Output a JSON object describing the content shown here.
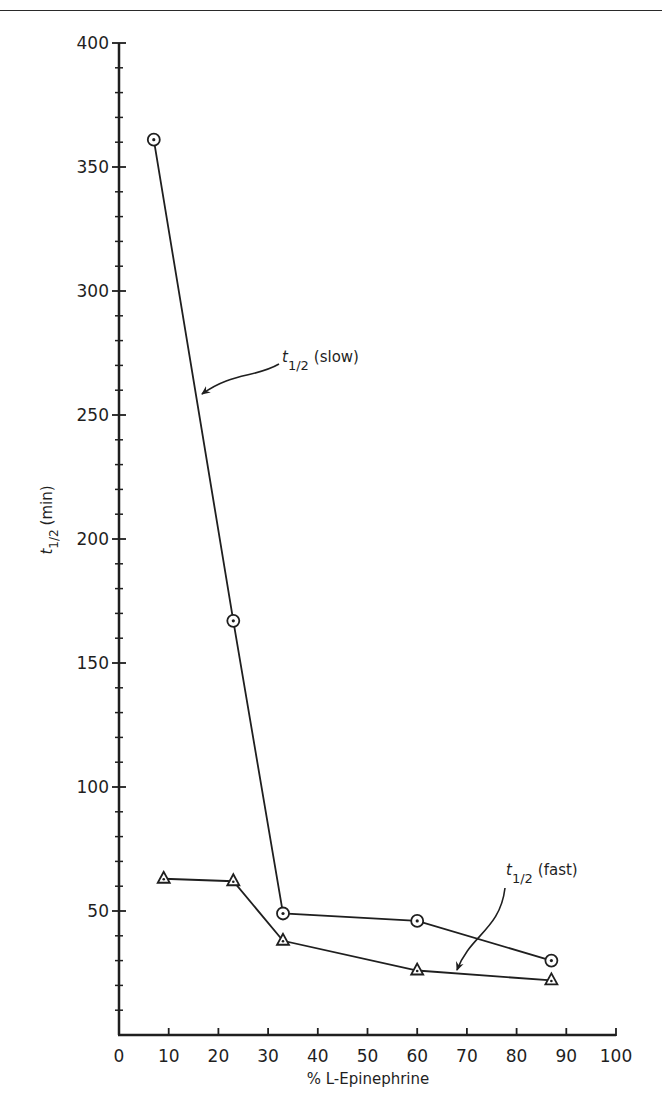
{
  "chart_data": {
    "type": "line",
    "title": "",
    "xlabel": "% L-Epinephrine",
    "ylabel": "t1/2 (min)",
    "ylabel_parts": {
      "t": "t",
      "sub": "1/2",
      "rest": "(min)"
    },
    "xlim": [
      0,
      100
    ],
    "ylim": [
      0,
      400
    ],
    "x_ticks": [
      0,
      10,
      20,
      30,
      40,
      50,
      60,
      70,
      80,
      90,
      100
    ],
    "x_tick_labels": [
      "0",
      "10",
      "20",
      "30",
      "40",
      "50",
      "60",
      "70",
      "80",
      "90",
      "100"
    ],
    "y_ticks": [
      50,
      100,
      150,
      200,
      250,
      300,
      350,
      400
    ],
    "y_tick_labels": [
      "50",
      "100",
      "150",
      "200",
      "250",
      "300",
      "350",
      "400"
    ],
    "y_minor_tick_step": 10,
    "grid": false,
    "legend": "none (inline annotations with arrows)",
    "series": [
      {
        "name": "t1/2 (slow)",
        "marker": "circle-dot",
        "x": [
          7,
          23,
          33,
          60,
          87
        ],
        "values": [
          361,
          167,
          49,
          46,
          30
        ]
      },
      {
        "name": "t1/2 (fast)",
        "marker": "triangle",
        "x": [
          9,
          23,
          33,
          60,
          87
        ],
        "values": [
          63,
          62,
          38,
          26,
          22
        ]
      }
    ],
    "annotations": [
      {
        "text_t": "t",
        "text_sub": "1/2",
        "text_rest": "(slow)",
        "points_to": "slow series"
      },
      {
        "text_t": "t",
        "text_sub": "1/2",
        "text_rest": "(fast)",
        "points_to": "fast series"
      }
    ]
  },
  "colors": {
    "ink": "#1f1f1f",
    "background": "#ffffff"
  }
}
